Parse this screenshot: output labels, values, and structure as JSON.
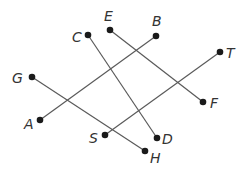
{
  "diagram": {
    "type": "line-segments",
    "colors": {
      "line": "#5a5a5a",
      "point": "#1a1a1a",
      "label": "#333333",
      "background": "#ffffff"
    },
    "points": [
      {
        "name": "A",
        "x": 40,
        "y": 120,
        "lx": 24,
        "ly": 129
      },
      {
        "name": "B",
        "x": 156,
        "y": 36,
        "lx": 152,
        "ly": 26
      },
      {
        "name": "C",
        "x": 88,
        "y": 35,
        "lx": 72,
        "ly": 42
      },
      {
        "name": "D",
        "x": 157,
        "y": 138,
        "lx": 162,
        "ly": 144
      },
      {
        "name": "E",
        "x": 110,
        "y": 30,
        "lx": 104,
        "ly": 21
      },
      {
        "name": "F",
        "x": 203,
        "y": 102,
        "lx": 210,
        "ly": 108
      },
      {
        "name": "G",
        "x": 32,
        "y": 77,
        "lx": 12,
        "ly": 83
      },
      {
        "name": "H",
        "x": 145,
        "y": 151,
        "lx": 150,
        "ly": 163
      },
      {
        "name": "S",
        "x": 105,
        "y": 135,
        "lx": 89,
        "ly": 143
      },
      {
        "name": "T",
        "x": 220,
        "y": 52,
        "lx": 226,
        "ly": 58
      }
    ],
    "segments": [
      {
        "from": "A",
        "to": "B"
      },
      {
        "from": "G",
        "to": "H"
      },
      {
        "from": "C",
        "to": "D"
      },
      {
        "from": "E",
        "to": "F"
      },
      {
        "from": "S",
        "to": "T"
      }
    ]
  }
}
